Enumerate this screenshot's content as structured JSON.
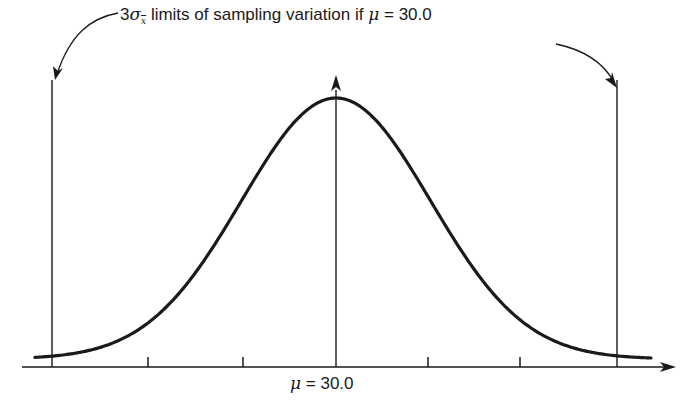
{
  "annotation": {
    "prefix": "3",
    "sigma": "σ",
    "subscript": "x",
    "text": " limits of sampling variation if ",
    "mu": "μ",
    "equals": " = ",
    "value": "30.0"
  },
  "axis_label": {
    "mu": "μ",
    "equals": " = ",
    "value": "30.0"
  },
  "colors": {
    "line": "#1a1a1a",
    "background": "#ffffff"
  },
  "chart_data": {
    "type": "line",
    "xlabel": "μ = 30.0",
    "ylabel": "",
    "center": 30.0,
    "ticks_sigma": [
      -3,
      -2,
      -1,
      0,
      1,
      2,
      3
    ],
    "tick_labels": [
      "",
      "",
      "",
      "μ = 30.0",
      "",
      "",
      ""
    ],
    "limit_lines_sigma": [
      -3,
      3
    ],
    "grid": false,
    "legend": null
  }
}
